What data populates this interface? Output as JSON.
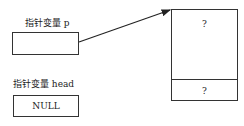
{
  "diagram": {
    "pointer_p": {
      "label": "指针变量 p",
      "value": ""
    },
    "pointer_head": {
      "label": "指针变量 head",
      "value": "NULL"
    },
    "node": {
      "data_field": "?",
      "next_field": "?"
    },
    "arrow": {
      "from": "pointer_p",
      "to": "node"
    },
    "colors": {
      "line": "#333333",
      "background": "#ffffff"
    }
  }
}
